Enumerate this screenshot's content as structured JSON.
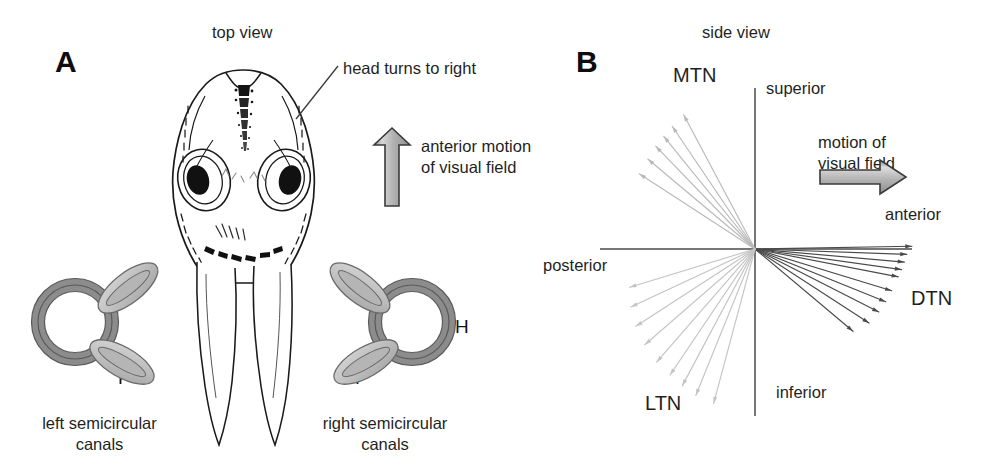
{
  "figure": {
    "background_color": "#ffffff"
  },
  "panelA": {
    "letter": "A",
    "view_label": "top view",
    "callout_label": "head turns to right",
    "arrow_label_line1": "anterior motion",
    "arrow_label_line2": "of visual field",
    "arrow_direction": "up",
    "arrow_color": "#b3b3b3",
    "left_canals": {
      "caption_line1": "left semicircular",
      "caption_line2": "canals",
      "anterior_label": "A",
      "horizontal_label": "H",
      "posterior_label": "P"
    },
    "right_canals": {
      "caption_line1": "right semicircular",
      "caption_line2": "canals",
      "anterior_label": "A",
      "horizontal_label": "H",
      "posterior_label": "P"
    },
    "specimen": "larval fish head, dorsal view"
  },
  "panelB": {
    "letter": "B",
    "view_label": "side view",
    "arrow_label_line1": "motion of",
    "arrow_label_line2": "visual field",
    "arrow_direction": "right",
    "arrow_color": "#b3b3b3",
    "axis_labels": {
      "superior": "superior",
      "inferior": "inferior",
      "anterior": "anterior",
      "posterior": "posterior"
    },
    "cluster_labels": {
      "mtn": "MTN",
      "dtn": "DTN",
      "ltn": "LTN"
    }
  },
  "chart_data": {
    "type": "scatter",
    "title": "side view",
    "origin_px": [
      755,
      249
    ],
    "axes": {
      "horizontal": {
        "from_label": "posterior",
        "to_label": "anterior",
        "x_range_px": [
          600,
          912
        ],
        "y_px": 249
      },
      "vertical": {
        "from_label": "inferior",
        "to_label": "superior",
        "y_range_px": [
          88,
          416
        ],
        "x_px": 755
      },
      "grid": false,
      "angle_convention": "degrees counter-clockwise from anterior (positive x axis)"
    },
    "legend_position": "inline cluster labels",
    "series": [
      {
        "name": "MTN",
        "color": "#b9b9b9",
        "quadrant": "superior-posterior",
        "count": 6,
        "angles_deg": [
          118,
          124,
          129,
          134,
          140,
          147
        ],
        "lengths_px": [
          152,
          148,
          145,
          143,
          140,
          138
        ]
      },
      {
        "name": "DTN",
        "color": "#4a4a4a",
        "quadrant": "inferior-anterior",
        "count": 10,
        "angles_deg": [
          1,
          -2,
          -5,
          -8,
          -11,
          -17,
          -22,
          -27,
          -33,
          -40
        ],
        "lengths_px": [
          157,
          152,
          150,
          148,
          146,
          143,
          141,
          139,
          136,
          128
        ]
      },
      {
        "name": "LTN",
        "color": "#c4c4c4",
        "quadrant": "inferior-posterior",
        "count": 9,
        "angles_deg": [
          -105,
          -112,
          -118,
          -124,
          -131,
          -139,
          -147,
          -155,
          -163
        ],
        "lengths_px": [
          160,
          158,
          155,
          152,
          150,
          146,
          142,
          137,
          131
        ]
      }
    ]
  }
}
